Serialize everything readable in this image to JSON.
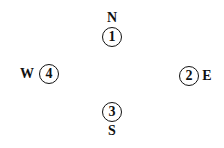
{
  "compass": {
    "north": {
      "letter": "N",
      "number": "1"
    },
    "east": {
      "letter": "E",
      "number": "2"
    },
    "south": {
      "letter": "S",
      "number": "3"
    },
    "west": {
      "letter": "W",
      "number": "4"
    }
  }
}
